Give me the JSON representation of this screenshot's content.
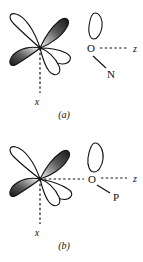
{
  "figure": {
    "type": "chemical-orbital-diagram",
    "background_color": "#ffffff",
    "line_color": "#111111",
    "panels": [
      {
        "id": "a",
        "caption": "(a)",
        "central_atom_label": "O",
        "substituent_atom_label": "N",
        "axis_labels": {
          "horizontal": "z",
          "vertical": "x"
        },
        "orbital": {
          "name": "d-orbital",
          "lobe_count": 4,
          "shaded_lobes": [
            "upper-right",
            "lower-left"
          ],
          "unshaded_lobes": [
            "upper-left",
            "lower-right"
          ]
        },
        "lone_pair": {
          "name": "lone-pair-lobe",
          "shape": "teardrop",
          "orientation": "up",
          "shaded": false
        },
        "bond": {
          "from": "O",
          "to": "N",
          "style": "solid"
        },
        "z_axis_style": "dashed",
        "x_axis_style": "dashed"
      },
      {
        "id": "b",
        "caption": "(b)",
        "central_atom_label": "O",
        "substituent_atom_label": "P",
        "axis_labels": {
          "horizontal": "z",
          "vertical": "x"
        },
        "orbital": {
          "name": "d-orbital",
          "lobe_count": 4,
          "shaded_lobes": [
            "upper-right",
            "lower-left"
          ],
          "unshaded_lobes": [
            "upper-left",
            "lower-right"
          ]
        },
        "lone_pair": {
          "name": "lone-pair-lobe",
          "shape": "teardrop",
          "orientation": "up",
          "shaded": false
        },
        "bond": {
          "from": "O",
          "to": "P",
          "style": "solid"
        },
        "z_axis_style": "dashed",
        "x_axis_style": "dashed",
        "overlap_line_style": "dashed"
      }
    ]
  }
}
